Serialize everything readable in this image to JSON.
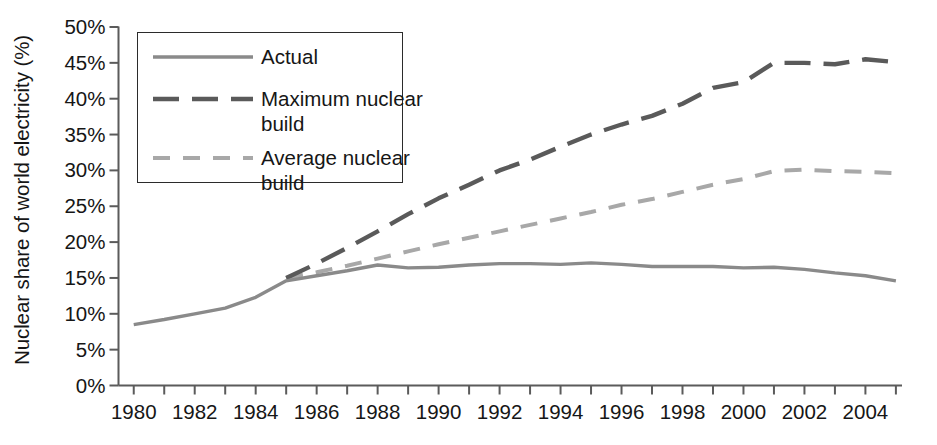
{
  "chart_data": {
    "type": "line",
    "title": "",
    "xlabel": "",
    "ylabel": "Nuclear share of world electricity (%)",
    "xlim": [
      1979.5,
      2005.2
    ],
    "ylim": [
      0,
      50
    ],
    "grid": false,
    "legend_position": "top-left",
    "x_tick_labels": [
      "1980",
      "1982",
      "1984",
      "1986",
      "1988",
      "1990",
      "1992",
      "1994",
      "1996",
      "1998",
      "2000",
      "2002",
      "2004"
    ],
    "x_tick_values": [
      1980,
      1982,
      1984,
      1986,
      1988,
      1990,
      1992,
      1994,
      1996,
      1998,
      2000,
      2002,
      2004
    ],
    "x_minor_tick_values": [
      1981,
      1983,
      1985,
      1987,
      1989,
      1991,
      1993,
      1995,
      1997,
      1999,
      2001,
      2003,
      2005
    ],
    "y_tick_labels": [
      "0%",
      "5%",
      "10%",
      "15%",
      "20%",
      "25%",
      "30%",
      "35%",
      "40%",
      "45%",
      "50%"
    ],
    "y_tick_values": [
      0,
      5,
      10,
      15,
      20,
      25,
      30,
      35,
      40,
      45,
      50
    ],
    "series": [
      {
        "name": "Actual",
        "style": "solid",
        "color": "#8a8a8a",
        "width": 3.4,
        "x": [
          1980,
          1981,
          1982,
          1983,
          1984,
          1985,
          1986,
          1987,
          1988,
          1989,
          1990,
          1991,
          1992,
          1993,
          1994,
          1995,
          1996,
          1997,
          1998,
          1999,
          2000,
          2001,
          2002,
          2003,
          2004,
          2005
        ],
        "values": [
          8.5,
          9.2,
          10.0,
          10.8,
          12.3,
          14.6,
          15.3,
          16.0,
          16.8,
          16.4,
          16.5,
          16.8,
          17.0,
          17.0,
          16.9,
          17.1,
          16.9,
          16.6,
          16.6,
          16.6,
          16.4,
          16.5,
          16.2,
          15.7,
          15.3,
          14.6
        ]
      },
      {
        "name": "Maximum nuclear\nbuild",
        "style": "dashed-long",
        "color": "#5a5a5a",
        "width": 4.4,
        "x": [
          1985,
          1986,
          1987,
          1988,
          1989,
          1990,
          1991,
          1992,
          1993,
          1994,
          1995,
          1996,
          1997,
          1998,
          1999,
          2000,
          2001,
          2002,
          2003,
          2004,
          2005
        ],
        "values": [
          15.0,
          17.0,
          19.2,
          21.5,
          23.9,
          26.1,
          28.0,
          30.0,
          31.5,
          33.3,
          35.0,
          36.4,
          37.6,
          39.3,
          41.5,
          42.3,
          45.0,
          45.0,
          44.8,
          45.5,
          45.1
        ]
      },
      {
        "name": "Average nuclear\nbuild",
        "style": "dashed-short",
        "color": "#a8a8a8",
        "width": 4.0,
        "x": [
          1985,
          1986,
          1987,
          1988,
          1989,
          1990,
          1991,
          1992,
          1993,
          1994,
          1995,
          1996,
          1997,
          1998,
          1999,
          2000,
          2001,
          2002,
          2003,
          2004,
          2005
        ],
        "values": [
          15.0,
          15.8,
          16.7,
          17.7,
          18.7,
          19.7,
          20.6,
          21.5,
          22.4,
          23.3,
          24.2,
          25.2,
          26.0,
          27.0,
          28.0,
          28.8,
          29.9,
          30.1,
          29.9,
          29.8,
          29.6
        ]
      }
    ]
  },
  "legend": {
    "items": [
      {
        "label": "Actual"
      },
      {
        "label": "Maximum nuclear\nbuild"
      },
      {
        "label": "Average nuclear\nbuild"
      }
    ]
  },
  "colors": {
    "actual": "#8a8a8a",
    "maximum": "#5a5a5a",
    "average": "#a8a8a8",
    "axis": "#5b5b5b",
    "text": "#161616"
  }
}
